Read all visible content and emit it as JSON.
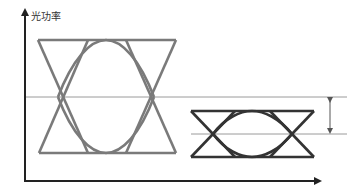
{
  "diagram": {
    "type": "eye-diagram-comparison",
    "y_axis_label": "光功率",
    "colors": {
      "axis": "#222222",
      "large_eye": "#7a7a7a",
      "small_eye": "#333333",
      "reference_lines": "#9a9a9a",
      "dimension_arrow": "#555555"
    },
    "large_eye": {
      "left": 38,
      "right": 176,
      "top": 40,
      "bottom": 153,
      "crossing_y": 97
    },
    "small_eye": {
      "left": 191,
      "right": 314,
      "top": 111,
      "bottom": 157,
      "crossing_y": 133
    },
    "annotation": {
      "label": "",
      "x": 330,
      "from_y": 97,
      "to_y": 134
    }
  }
}
